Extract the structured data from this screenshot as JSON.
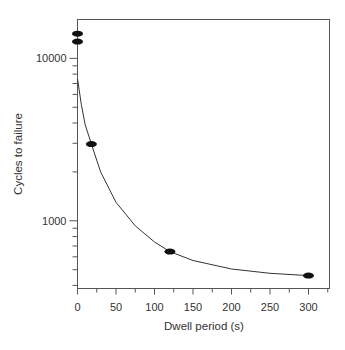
{
  "chart_data": {
    "type": "scatter",
    "title": "",
    "xlabel": "Dwell period (s)",
    "ylabel": "Cycles to failure",
    "yscale": "log",
    "xlim": [
      0,
      325
    ],
    "ylim": [
      383,
      17350
    ],
    "x_ticks": [
      0,
      50,
      100,
      150,
      200,
      250,
      300
    ],
    "x_tick_labels": [
      "0",
      "50",
      "100",
      "150",
      "200",
      "250",
      "300"
    ],
    "y_ticks": [
      1000,
      10000
    ],
    "y_tick_labels": [
      "1000",
      "10000"
    ],
    "grid": false,
    "legend": null,
    "series": [
      {
        "name": "Measured",
        "marker": "ellipse-filled",
        "x": [
          0,
          0,
          18,
          120,
          300
        ],
        "y": [
          14200,
          12700,
          2970,
          646,
          460
        ]
      },
      {
        "name": "Fitted curve",
        "style": "line",
        "x": [
          0,
          5,
          10,
          18,
          30,
          50,
          75,
          100,
          120,
          150,
          200,
          250,
          300
        ],
        "y": [
          7500,
          5200,
          3900,
          2970,
          2000,
          1300,
          930,
          740,
          646,
          570,
          505,
          475,
          460
        ]
      }
    ]
  }
}
